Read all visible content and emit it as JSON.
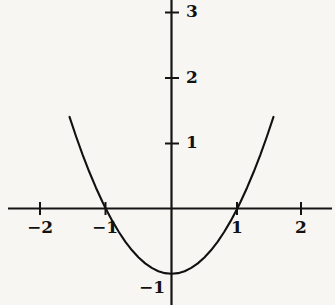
{
  "chart_data": {
    "type": "line",
    "title": "",
    "subtitle": "",
    "xlabel": "",
    "ylabel": "",
    "function": "y = x^2 - 1",
    "xlim": [
      -2.47,
      2.48
    ],
    "ylim": [
      -1.49,
      3.18
    ],
    "grid": false,
    "legend": null,
    "axes_style": "cartesian-cross",
    "x_ticks": [
      {
        "value": -2,
        "label": "−2"
      },
      {
        "value": -1,
        "label": "−1"
      },
      {
        "value": 1,
        "label": "1"
      },
      {
        "value": 2,
        "label": "2"
      }
    ],
    "y_ticks": [
      {
        "value": 3,
        "label": "3"
      },
      {
        "value": 2,
        "label": "2"
      },
      {
        "value": 1,
        "label": "1"
      },
      {
        "value": -1,
        "label": "−1"
      }
    ],
    "series": [
      {
        "name": "y = x^2 - 1",
        "color": "#111111",
        "x": [
          -1.55,
          -1.45,
          -1.35,
          -1.25,
          -1.15,
          -1.05,
          -1.0,
          -0.9,
          -0.8,
          -0.7,
          -0.6,
          -0.5,
          -0.4,
          -0.3,
          -0.2,
          -0.1,
          0.0,
          0.1,
          0.2,
          0.3,
          0.4,
          0.5,
          0.6,
          0.7,
          0.8,
          0.9,
          1.0,
          1.05,
          1.15,
          1.25,
          1.35,
          1.45,
          1.55
        ],
        "y": [
          1.4025,
          1.1025,
          0.8225,
          0.5625,
          0.3225,
          0.1025,
          0.0,
          -0.19,
          -0.36,
          -0.51,
          -0.64,
          -0.75,
          -0.84,
          -0.91,
          -0.96,
          -0.99,
          -1.0,
          -0.99,
          -0.96,
          -0.91,
          -0.84,
          -0.75,
          -0.64,
          -0.51,
          -0.36,
          -0.19,
          0.0,
          0.1025,
          0.3225,
          0.5625,
          0.8225,
          1.1025,
          1.4025
        ]
      }
    ],
    "roots": [
      -1,
      1
    ],
    "vertex": {
      "x": 0,
      "y": -1
    },
    "colors": {
      "background": "#f7f6f3",
      "axis": "#141414",
      "curve": "#111111",
      "text": "#121212"
    }
  }
}
